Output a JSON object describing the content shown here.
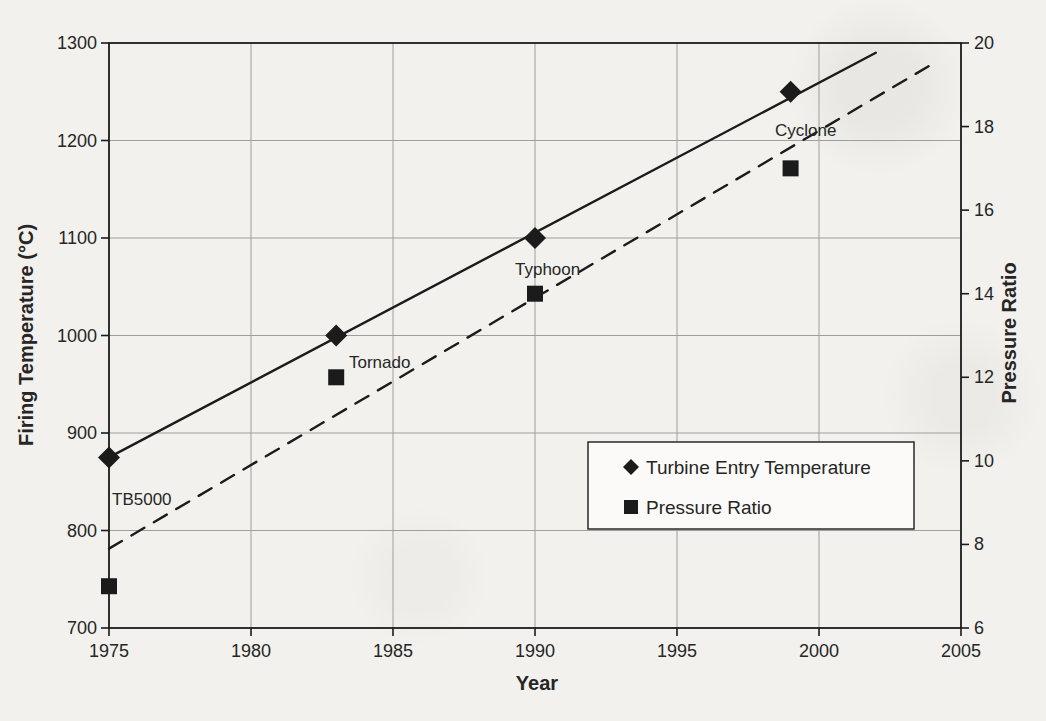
{
  "figure": {
    "background": "#f2f1ed",
    "ink_color": "#1b1b1b",
    "grid_color": "#9e9e9e",
    "legend_fill": "#fbfaf8"
  },
  "chart_data": {
    "type": "scatter",
    "title": "",
    "xlabel": "Year",
    "ylabel_left": "Firing Temperature (°C)",
    "ylabel_right": "Pressure Ratio",
    "xlim": [
      1975,
      2005
    ],
    "ylim_left": [
      700,
      1300
    ],
    "ylim_right": [
      6,
      20
    ],
    "x_ticks": [
      1975,
      1980,
      1985,
      1990,
      1995,
      2000,
      2005
    ],
    "y_left_ticks": [
      700,
      800,
      900,
      1000,
      1100,
      1200,
      1300
    ],
    "y_right_ticks": [
      6,
      8,
      10,
      12,
      14,
      16,
      18,
      20
    ],
    "grid": true,
    "machines": [
      {
        "name": "TB5000",
        "year": 1975,
        "tet_c": 875,
        "pressure_ratio": 7,
        "label_px": [
          112,
          505
        ]
      },
      {
        "name": "Tornado",
        "year": 1983,
        "tet_c": 1000,
        "pressure_ratio": 12,
        "label_px": [
          349,
          368
        ]
      },
      {
        "name": "Typhoon",
        "year": 1990,
        "tet_c": 1100,
        "pressure_ratio": 14,
        "label_px": [
          515,
          275
        ]
      },
      {
        "name": "Cyclone",
        "year": 1999,
        "tet_c": 1250,
        "pressure_ratio": 17,
        "label_px": [
          775,
          136
        ]
      }
    ],
    "series": [
      {
        "name": "Turbine Entry Temperature",
        "marker": "diamond",
        "axis": "left",
        "value_field": "tet_c",
        "trendline": {
          "style": "solid",
          "from": [
            1975,
            875
          ],
          "to": [
            2002,
            1290
          ]
        }
      },
      {
        "name": "Pressure Ratio",
        "marker": "square",
        "axis": "right",
        "value_field": "pressure_ratio",
        "trendline": {
          "style": "dashed",
          "from": [
            1975,
            7.9
          ],
          "to": [
            2004,
            19.5
          ]
        }
      }
    ],
    "legend": {
      "position": "inside-lower-right",
      "box_px": [
        588,
        442,
        326,
        87
      ],
      "items": [
        {
          "label": "Turbine Entry Temperature",
          "marker": "diamond"
        },
        {
          "label": "Pressure Ratio",
          "marker": "square"
        }
      ]
    }
  }
}
